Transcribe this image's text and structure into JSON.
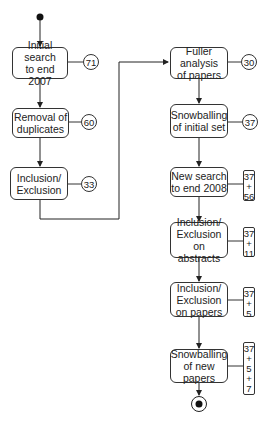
{
  "diagram": {
    "type": "activity-flowchart",
    "left_column": [
      {
        "id": "initial-search",
        "label": "Initial search\nto end 2007",
        "count": "71"
      },
      {
        "id": "removal-duplicates",
        "label": "Removal of\nduplicates",
        "count": "60"
      },
      {
        "id": "inclusion-exclusion",
        "label": "Inclusion/\nExclusion",
        "count": "33"
      }
    ],
    "right_column": [
      {
        "id": "fuller-analysis",
        "label": "Fuller analysis\nof papers",
        "count": "30"
      },
      {
        "id": "snowballing-initial",
        "label": "Snowballing\nof initial set",
        "count": "37"
      },
      {
        "id": "new-search",
        "label": "New search\nto end 2008",
        "count_parts": [
          "37",
          "+",
          "56"
        ]
      },
      {
        "id": "inclusion-exclusion-abstracts",
        "label": "Inclusion/\nExclusion\non abstracts",
        "count_parts": [
          "37",
          "+",
          "11"
        ]
      },
      {
        "id": "inclusion-exclusion-papers",
        "label": "Inclusion/\nExclusion\non papers",
        "count_parts": [
          "37",
          "+",
          "5"
        ]
      },
      {
        "id": "snowballing-new",
        "label": "Snowballing\nof new papers",
        "count_parts": [
          "37",
          "+",
          "5",
          "+",
          "7"
        ]
      }
    ],
    "start_node": "filled-circle",
    "end_node": "bullseye-circle"
  }
}
